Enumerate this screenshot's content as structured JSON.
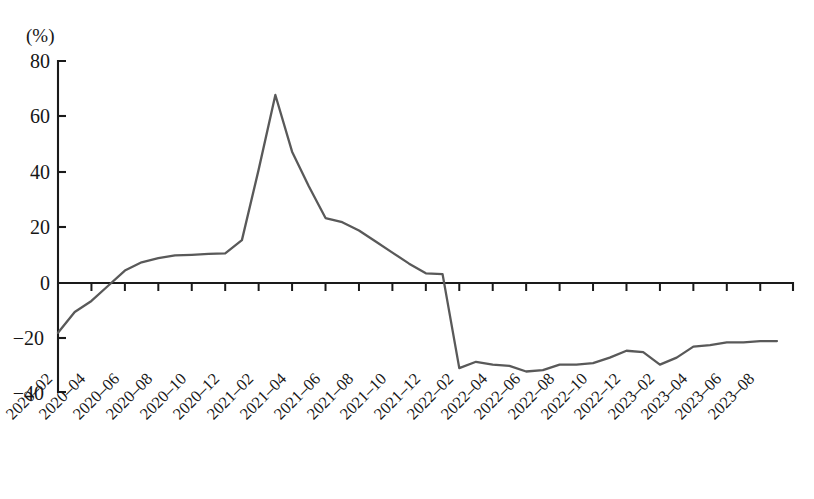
{
  "chart_data": {
    "type": "line",
    "title": "",
    "subtitle": "",
    "xlabel": "",
    "ylabel": "",
    "unit_label": "(%)",
    "ylim": [
      -40,
      80
    ],
    "yticks": [
      80,
      60,
      40,
      20,
      0,
      -20,
      -40
    ],
    "ytick_labels": [
      "80",
      "60",
      "40",
      "20",
      "0",
      "−20",
      "−40"
    ],
    "grid": false,
    "legend": null,
    "legend_position": "none",
    "line_color": "#595959",
    "axis_color": "#1a1a1a",
    "zero_line": 0,
    "xtick_labels": [
      "2020-02",
      "2020-04",
      "2020-06",
      "2020-08",
      "2020-10",
      "2020-12",
      "2021-02",
      "2021-04",
      "2021-06",
      "2021-08",
      "2021-10",
      "2021-12",
      "2022-02",
      "2022-04",
      "2022-06",
      "2022-08",
      "2022-10",
      "2022-12",
      "2023-02",
      "2023-04",
      "2023-06",
      "2023-08"
    ],
    "x": [
      "2020-02",
      "2020-03",
      "2020-04",
      "2020-05",
      "2020-06",
      "2020-07",
      "2020-08",
      "2020-09",
      "2020-10",
      "2020-11",
      "2020-12",
      "2021-01",
      "2021-02",
      "2021-03",
      "2021-04",
      "2021-05",
      "2021-06",
      "2021-07",
      "2021-08",
      "2021-09",
      "2021-10",
      "2021-11",
      "2021-12",
      "2022-01",
      "2022-02",
      "2022-03",
      "2022-04",
      "2022-05",
      "2022-06",
      "2022-07",
      "2022-08",
      "2022-09",
      "2022-10",
      "2022-11",
      "2022-12",
      "2023-01",
      "2023-02",
      "2023-03",
      "2023-04",
      "2023-05",
      "2023-06",
      "2023-07",
      "2023-08",
      "2023-09"
    ],
    "values": [
      -18.0,
      -10.5,
      -6.5,
      -1.0,
      4.5,
      7.5,
      9.0,
      10.0,
      10.2,
      10.5,
      10.7,
      15.5,
      41.0,
      68.0,
      47.5,
      35.0,
      23.5,
      22.0,
      19.0,
      15.0,
      11.0,
      7.0,
      3.5,
      3.2,
      -30.8,
      -28.5,
      -29.5,
      -30.0,
      -32.0,
      -31.5,
      -29.5,
      -29.5,
      -29.0,
      -27.0,
      -24.5,
      -25.0,
      -29.5,
      -27.0,
      -23.0,
      -22.5,
      -21.5,
      -21.5,
      -21.0,
      -21.0
    ]
  }
}
